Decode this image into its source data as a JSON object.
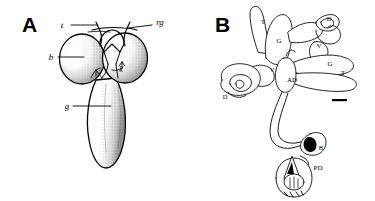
{
  "figure": {
    "background_color": "#ffffff",
    "ink_color": "#000000",
    "panels": [
      {
        "letter": "A",
        "caption": "",
        "style": "stippled-shaded anatomical drawing",
        "labels": [
          {
            "key": "t",
            "text": "t",
            "position": "top-left"
          },
          {
            "key": "rg",
            "text": "rg",
            "position": "top-right"
          },
          {
            "key": "b",
            "text": "b",
            "position": "mid-left"
          },
          {
            "key": "k",
            "text": "k",
            "position": "center-right-inner"
          },
          {
            "key": "g",
            "text": "g",
            "position": "lower-left"
          }
        ]
      },
      {
        "letter": "B",
        "caption": "",
        "style": "outline line drawing",
        "labels": [
          {
            "key": "T1",
            "text": "T",
            "position": "upper-left-tubule"
          },
          {
            "key": "G1",
            "text": "G",
            "position": "upper-center"
          },
          {
            "key": "D1",
            "text": "D",
            "position": "upper-right-coil"
          },
          {
            "key": "V1",
            "text": "V",
            "position": "right-coil"
          },
          {
            "key": "G2",
            "text": "G",
            "position": "right-center"
          },
          {
            "key": "T2",
            "text": "T",
            "position": "right-tubule"
          },
          {
            "key": "V2",
            "text": "V",
            "position": "left-coil"
          },
          {
            "key": "AD",
            "text": "AD",
            "position": "center"
          },
          {
            "key": "D2",
            "text": "D",
            "position": "lower-left-coil"
          },
          {
            "key": "B",
            "text": "B",
            "position": "lower-center"
          },
          {
            "key": "PD",
            "text": "PD",
            "position": "bottom-right"
          }
        ],
        "scale_bar": {
          "present": true,
          "text": ""
        }
      }
    ]
  }
}
